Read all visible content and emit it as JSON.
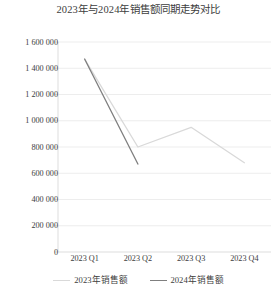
{
  "chart_data": {
    "type": "line",
    "title": "2023年与2024年销售额同期走势对比",
    "xlabel": "",
    "ylabel": "",
    "categories": [
      "2023 Q1",
      "2023 Q2",
      "2023 Q3",
      "2023 Q4"
    ],
    "ylim": [
      0,
      1600000
    ],
    "ytick_step": 200000,
    "ytick_labels": [
      "0",
      "200 000",
      "400 000",
      "600 000",
      "800 000",
      "1 000 000",
      "1 200 000",
      "1 400 000",
      "1 600 000"
    ],
    "ytick_values": [
      0,
      200000,
      400000,
      600000,
      800000,
      1000000,
      1200000,
      1400000,
      1600000
    ],
    "grid": "horizontal",
    "legend_position": "bottom",
    "series": [
      {
        "name": "2023年销售额",
        "color": "#d9d9d9",
        "values": [
          1470000,
          800000,
          950000,
          680000
        ]
      },
      {
        "name": "2024年销售额",
        "color": "#7f7f7f",
        "values": [
          1470000,
          670000,
          null,
          null
        ]
      }
    ]
  },
  "axis": {
    "line_color": "#d9d9d9",
    "grid_color": "#e8e8e8"
  }
}
